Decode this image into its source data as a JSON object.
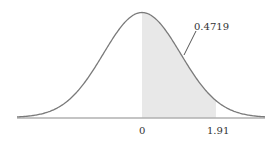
{
  "chart_data": {
    "type": "area",
    "title": "",
    "xlabel": "",
    "ylabel": "",
    "distribution": "standard normal",
    "x_ticks": [
      {
        "value": 0,
        "label": "0"
      },
      {
        "value": 1.91,
        "label": "1.91"
      }
    ],
    "shaded_region": {
      "from": 0,
      "to": 1.91,
      "area": 0.4719
    },
    "annotations": [
      {
        "text": "0.4719",
        "points_to": "shaded area between 0 and 1.91"
      }
    ],
    "xlim": [
      -3.2,
      3.2
    ],
    "grid": false,
    "legend": null
  },
  "colors": {
    "curve": "#7a7a7a",
    "axis": "#8a8a8a",
    "shade": "#e8e8e8",
    "text": "#333333"
  },
  "labels": {
    "annotation": "0.4719",
    "tick_zero": "0",
    "tick_z": "1.91"
  }
}
